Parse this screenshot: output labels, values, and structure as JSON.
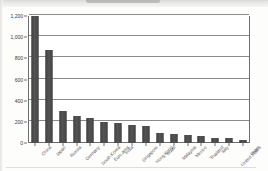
{
  "chart_data": {
    "type": "bar",
    "title": "",
    "subtitle": "",
    "xlabel": "",
    "ylabel": "",
    "ylim": [
      0,
      1200
    ],
    "grid": true,
    "legend": false,
    "legend_position": "none",
    "orientation": "vertical",
    "bar_color": "#4a4a4a",
    "y_ticks": [
      0,
      200,
      400,
      600,
      800,
      1000,
      1200
    ],
    "y_tick_labels": [
      "0",
      "200",
      "400",
      "600",
      "800",
      "1,000",
      "1,200"
    ],
    "categories": [
      "China",
      "Japan",
      "Russia",
      "Germany",
      "South Korea",
      "Euro area",
      "India",
      "Singapore",
      "Hong Kong",
      "Brazil",
      "Malaysia",
      "Mexico",
      "Thailand",
      "Italy",
      "United States",
      "Israel"
    ],
    "values": [
      1200,
      880,
      300,
      255,
      235,
      200,
      192,
      170,
      165,
      95,
      88,
      75,
      62,
      52,
      45,
      33
    ]
  }
}
